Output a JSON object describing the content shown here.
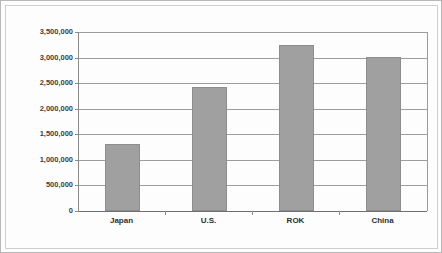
{
  "chart_data": {
    "type": "bar",
    "title": "",
    "subtitle": "",
    "xlabel": "",
    "ylabel": "Metric Tons",
    "categories": [
      "Japan",
      "U.S.",
      "ROK",
      "China"
    ],
    "values": [
      1310000,
      2420000,
      3250000,
      3010000
    ],
    "ylim": [
      0,
      3500000
    ],
    "ytick_values": [
      0,
      500000,
      1000000,
      1500000,
      2000000,
      2500000,
      3000000,
      3500000
    ],
    "ytick_labels": [
      "0",
      "500,000",
      "1,000,000",
      "1,500,000",
      "2,000,000",
      "2,500,000",
      "3,000,000",
      "3,500,000"
    ],
    "grid": true,
    "grid_axis": "y",
    "legend": false,
    "legend_position": "none",
    "annotations": [],
    "colors": {
      "bar_fill": "#a0a0a0",
      "bar_border": "#8d8d8d",
      "gridline": "#9d9d9d",
      "axis_line": "#8a8a8a",
      "baseline": "#6f6f6f",
      "tick_label": "#3f3f3f",
      "category_label": "#2f2f2f",
      "plot_background": "#ffffff",
      "figure_background": "#fdfdfd",
      "figure_border": "#b8b8b8"
    }
  }
}
